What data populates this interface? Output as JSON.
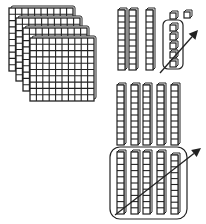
{
  "diagram": {
    "hundreds": {
      "count": 4,
      "grid": 10
    },
    "tens_group_top": {
      "rods": 3
    },
    "ones_group": {
      "loose_cubes": 2,
      "circled_cubes": 5
    },
    "tens_group_bottom": {
      "rods_top": 5,
      "circled_rods": 5
    },
    "colors": {
      "stroke": "#222222",
      "fill": "#ffffff"
    }
  }
}
